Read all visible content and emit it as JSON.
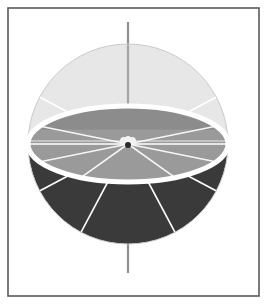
{
  "figure": {
    "title": "Sphere with equatorial plane and meridian sectors",
    "canvas": {
      "width": 267,
      "height": 304,
      "background": "#ffffff"
    },
    "frame": {
      "name": "border-frame",
      "x": 8,
      "y": 8,
      "width": 251,
      "height": 288,
      "stroke": "#5a5a5a",
      "stroke_width": 1.6
    },
    "sphere": {
      "center_x": 128,
      "center_y": 144,
      "radius": 100,
      "equator_ry": 38,
      "upper_hemisphere_color": "#e7e7e7",
      "upper_hemisphere_outline": "#c9c9c9",
      "lower_hemisphere_color": "#3a3a3a",
      "equator_disk_color": "#9a9a9a",
      "equator_disk_shadow_color": "#8c8c8c",
      "equator_rim_color": "#ffffff",
      "equator_rim_width": 5,
      "meridian_color": "#ffffff",
      "meridian_width": 1.6
    },
    "axis": {
      "name": "polar-axis",
      "color": "#8f8f8f",
      "width": 2.2,
      "top_y": 22,
      "bottom_y": 273
    },
    "center_marker": {
      "name": "origin-marker",
      "dark_color": "#2b2b2b",
      "light_color": "#f2f2f2",
      "radius": 4
    },
    "meridians": [
      {
        "label": "meridian-up-left",
        "angle_deg": 208,
        "hemisphere": "upper"
      },
      {
        "label": "meridian-up-right",
        "angle_deg": 332,
        "hemisphere": "upper"
      },
      {
        "label": "meridian-left",
        "angle_deg": 180,
        "hemisphere": "equator"
      },
      {
        "label": "meridian-right",
        "angle_deg": 0,
        "hemisphere": "equator"
      },
      {
        "label": "meridian-down-left",
        "angle_deg": 152,
        "hemisphere": "lower"
      },
      {
        "label": "meridian-down-right",
        "angle_deg": 28,
        "hemisphere": "lower"
      },
      {
        "label": "meridian-front-left",
        "angle_deg": 118,
        "hemisphere": "lower"
      },
      {
        "label": "meridian-front-right",
        "angle_deg": 62,
        "hemisphere": "lower"
      }
    ],
    "labels": {
      "upper_hemisphere": "Upper hemisphere",
      "lower_hemisphere": "Lower hemisphere",
      "equatorial_plane": "Equatorial plane",
      "polar_axis": "Polar axis",
      "origin": "Origin"
    }
  }
}
